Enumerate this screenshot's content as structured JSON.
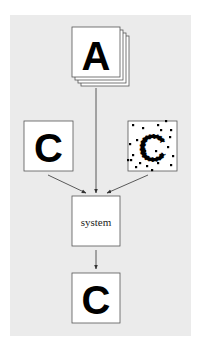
{
  "diagram": {
    "background": "#ebebeb",
    "nodes": {
      "input_stack": {
        "letter": "A",
        "kind": "stacked image set"
      },
      "clean_input": {
        "letter": "C",
        "kind": "clean image"
      },
      "noisy_input": {
        "letter": "C",
        "kind": "noisy image"
      },
      "system": {
        "label": "system"
      },
      "output": {
        "letter": "C",
        "kind": "reconstructed image"
      }
    },
    "edges": [
      {
        "from": "input_stack",
        "to": "system"
      },
      {
        "from": "clean_input",
        "to": "system"
      },
      {
        "from": "noisy_input",
        "to": "system"
      },
      {
        "from": "system",
        "to": "output"
      }
    ],
    "noise_dots": [
      [
        133,
        125
      ],
      [
        143,
        128
      ],
      [
        158,
        125
      ],
      [
        166,
        121
      ],
      [
        171,
        130
      ],
      [
        137,
        140
      ],
      [
        133,
        155
      ],
      [
        131,
        160
      ],
      [
        136,
        167
      ],
      [
        147,
        166
      ],
      [
        158,
        163
      ],
      [
        168,
        147
      ],
      [
        173,
        156
      ],
      [
        161,
        130
      ],
      [
        148,
        137
      ],
      [
        163,
        140
      ],
      [
        145,
        151
      ],
      [
        140,
        163
      ],
      [
        171,
        165
      ],
      [
        152,
        170
      ],
      [
        128,
        160
      ],
      [
        130,
        144
      ],
      [
        156,
        151
      ],
      [
        170,
        137
      ]
    ]
  }
}
